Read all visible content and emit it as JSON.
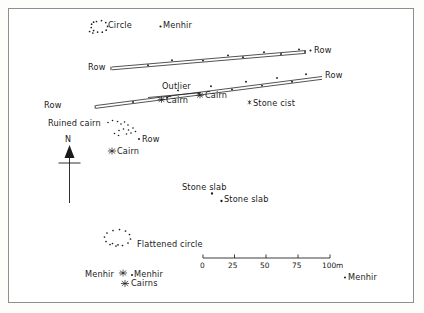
{
  "figure": {
    "kind": "archaeological-site-plan",
    "background": "#ffffff",
    "ink": "#1a1a1a",
    "frame_color": "#8e8e8e"
  },
  "north": {
    "label": "N"
  },
  "scalebar": {
    "ticks": [
      "0",
      "25",
      "50",
      "75"
    ],
    "end_label": "100m"
  },
  "labels": {
    "circle": "Circle",
    "menhir_top": "Menhir",
    "row_left_upper": "Row",
    "row_right_upper": "Row",
    "row_right_mid": "Row",
    "outlier": "Outlier",
    "cairn_a": "Cairn",
    "cairn_b": "Cairn",
    "stone_cist": "Stone cist",
    "row_left_lower": "Row",
    "ruined_cairn": "Ruined cairn",
    "row_small": "Row",
    "cairn_c": "Cairn",
    "stone_slab_1": "Stone slab",
    "stone_slab_2": "Stone slab",
    "flattened_circle": "Flattened circle",
    "menhir_left": "Menhir",
    "menhir_mid": "Menhir",
    "cairns": "Cairns",
    "menhir_right": "Menhir"
  }
}
